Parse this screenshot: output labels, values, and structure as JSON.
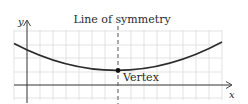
{
  "diagram": {
    "title_label": "Line of symmetry",
    "vertex_label": "Vertex",
    "x_axis_label": "x",
    "y_axis_label": "y",
    "colors": {
      "grid": "#dcdcdc",
      "axis": "#333333",
      "curve": "#2b2b2b",
      "symmetry_line": "#555555",
      "vertex_dot": "#111111",
      "text": "#2a2a2a"
    },
    "curve_type": "parabola opening upward",
    "elements": [
      "grid",
      "x-axis",
      "y-axis",
      "parabola",
      "dashed line of symmetry",
      "vertex point"
    ]
  }
}
